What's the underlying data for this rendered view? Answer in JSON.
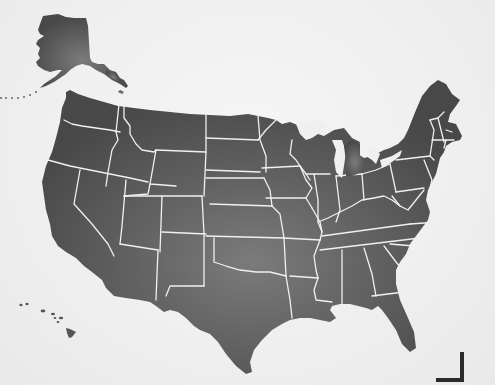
{
  "map": {
    "title": "United States",
    "regions": [
      "Alaska",
      "Contiguous United States",
      "Hawaii"
    ],
    "colors": {
      "background": "#f2f2f2",
      "land_dark": "#4a4a4a",
      "land_light": "#7a7a7a",
      "state_borders": "#f0f0f0",
      "crop_mark": "#2b2b2b"
    }
  }
}
